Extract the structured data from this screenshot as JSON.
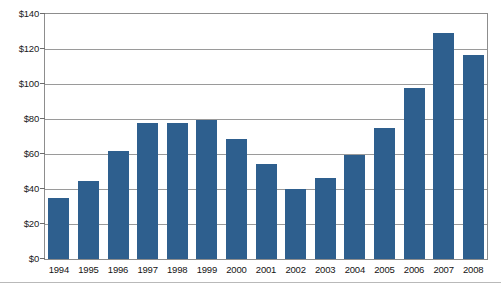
{
  "chart_data": {
    "type": "bar",
    "title": "",
    "subtitle": "",
    "xlabel": "",
    "ylabel": "",
    "categories": [
      "1994",
      "1995",
      "1996",
      "1997",
      "1998",
      "1999",
      "2000",
      "2001",
      "2002",
      "2003",
      "2004",
      "2005",
      "2006",
      "2007",
      "2008"
    ],
    "values": [
      35,
      44.5,
      61.5,
      78,
      77.5,
      79.5,
      68.5,
      54.5,
      40,
      46.5,
      59.5,
      75,
      97.5,
      129,
      116.5
    ],
    "series": [
      {
        "name": "",
        "values": [
          35,
          44.5,
          61.5,
          78,
          77.5,
          79.5,
          68.5,
          54.5,
          40,
          46.5,
          59.5,
          75,
          97.5,
          129,
          116.5
        ]
      }
    ],
    "ylim": [
      0,
      140
    ],
    "ytick_values": [
      0,
      20,
      40,
      60,
      80,
      100,
      120,
      140
    ],
    "ytick_labels": [
      "$0",
      "$20",
      "$40",
      "$60",
      "$80",
      "$100",
      "$120",
      "$140"
    ],
    "grid": "horizontal",
    "legend": "none",
    "bar_color": "#2e5f8e",
    "gridline_color": "#9a9a9a",
    "frame_color": "#8d8d8d",
    "background_color": "#ffffff"
  }
}
